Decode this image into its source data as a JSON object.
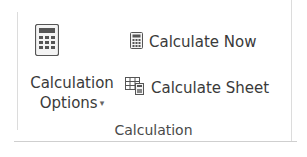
{
  "group": {
    "label": "Calculation",
    "calculation_options": {
      "line1": "Calculation",
      "line2": "Options",
      "dropdown_caret": "▾",
      "icon": "calculator-icon"
    },
    "calculate_now": {
      "label": "Calculate Now",
      "icon": "calculator-icon"
    },
    "calculate_sheet": {
      "label": "Calculate Sheet",
      "icon": "sheet-calculator-icon"
    }
  }
}
